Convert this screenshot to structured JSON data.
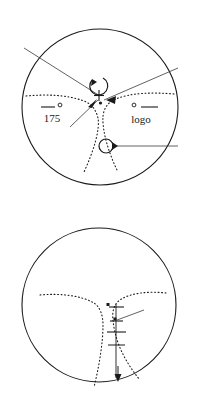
{
  "document": {
    "type": "technical-figure",
    "panel_count": 2,
    "background_color": "#ffffff",
    "ink_color": "#1a1a1a"
  },
  "figure_top": {
    "name": "upper-circular-diagram",
    "boundary": {
      "shape": "circle",
      "cx": 100,
      "cy": 107,
      "r": 78
    },
    "labels": [
      {
        "id": "label-175",
        "text": "175",
        "x": 55,
        "y": 122
      },
      {
        "id": "label-logo",
        "text": "logo",
        "x": 145,
        "y": 122
      }
    ],
    "markers": [
      {
        "id": "center-cross",
        "symbol": "+",
        "x": 99,
        "y": 96
      },
      {
        "id": "center-dot",
        "symbol": "•",
        "x": 100,
        "y": 103
      },
      {
        "id": "marker-dot-175",
        "symbol": "○",
        "x": 60,
        "y": 105
      },
      {
        "id": "marker-dot-logo",
        "symbol": "○",
        "x": 134,
        "y": 105
      }
    ],
    "loops": [
      {
        "id": "loop-upper",
        "cx": 97,
        "cy": 83,
        "r": 9,
        "arrow": "down-left"
      },
      {
        "id": "loop-lower",
        "cx": 107,
        "cy": 146,
        "r": 7,
        "arrow": "right"
      }
    ]
  },
  "figure_bottom": {
    "name": "lower-circular-diagram",
    "boundary": {
      "shape": "circle",
      "cx": 99,
      "cy": 305,
      "r": 77
    },
    "markers": [
      {
        "id": "node-dot-top",
        "symbol": "▪",
        "x": 108,
        "y": 305
      },
      {
        "id": "node-dot-mid",
        "symbol": "▪",
        "x": 115,
        "y": 318
      },
      {
        "id": "tick-cross-upper",
        "symbol": "†",
        "x": 117,
        "y": 310
      },
      {
        "id": "tick-cross-lower",
        "symbol": "+",
        "x": 116,
        "y": 332
      },
      {
        "id": "arrow-bottom",
        "symbol": "↓",
        "x": 118,
        "y": 375
      }
    ]
  }
}
